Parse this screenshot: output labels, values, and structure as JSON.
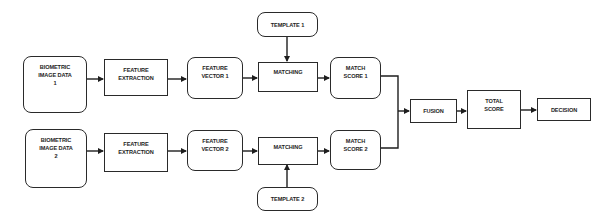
{
  "diagram": {
    "type": "flowchart",
    "nodes": {
      "bio1": {
        "label": "BIOMETRIC\nIMAGE DATA\n1",
        "shape": "rounded"
      },
      "fe1": {
        "label": "FEATURE\nEXTRACTION",
        "shape": "rect"
      },
      "fv1": {
        "label": "FEATURE\nVECTOR 1",
        "shape": "rounded"
      },
      "tpl1": {
        "label": "TEMPLATE 1",
        "shape": "rounded"
      },
      "m1": {
        "label": "MATCHING",
        "shape": "rect"
      },
      "ms1": {
        "label": "MATCH\nSCORE 1",
        "shape": "rounded"
      },
      "bio2": {
        "label": "BIOMETRIC\nIMAGE DATA\n2",
        "shape": "rounded"
      },
      "fe2": {
        "label": "FEATURE\nEXTRACTION",
        "shape": "rect"
      },
      "fv2": {
        "label": "FEATURE\nVECTOR 2",
        "shape": "rounded"
      },
      "tpl2": {
        "label": "TEMPLATE 2",
        "shape": "rounded"
      },
      "m2": {
        "label": "MATCHING",
        "shape": "rect"
      },
      "ms2": {
        "label": "MATCH\nSCORE 2",
        "shape": "rounded"
      },
      "fusion": {
        "label": "FUSION",
        "shape": "rect"
      },
      "total": {
        "label": "TOTAL\nSCORE",
        "shape": "rect"
      },
      "decision": {
        "label": "DECISION",
        "shape": "rect"
      }
    },
    "edges": [
      {
        "from": "bio1",
        "to": "fe1"
      },
      {
        "from": "fe1",
        "to": "fv1"
      },
      {
        "from": "fv1",
        "to": "m1"
      },
      {
        "from": "tpl1",
        "to": "m1"
      },
      {
        "from": "m1",
        "to": "ms1"
      },
      {
        "from": "ms1",
        "to": "fusion"
      },
      {
        "from": "bio2",
        "to": "fe2"
      },
      {
        "from": "fe2",
        "to": "fv2"
      },
      {
        "from": "fv2",
        "to": "m2"
      },
      {
        "from": "tpl2",
        "to": "m2"
      },
      {
        "from": "m2",
        "to": "ms2"
      },
      {
        "from": "ms2",
        "to": "fusion"
      },
      {
        "from": "fusion",
        "to": "total"
      },
      {
        "from": "total",
        "to": "decision"
      }
    ]
  }
}
